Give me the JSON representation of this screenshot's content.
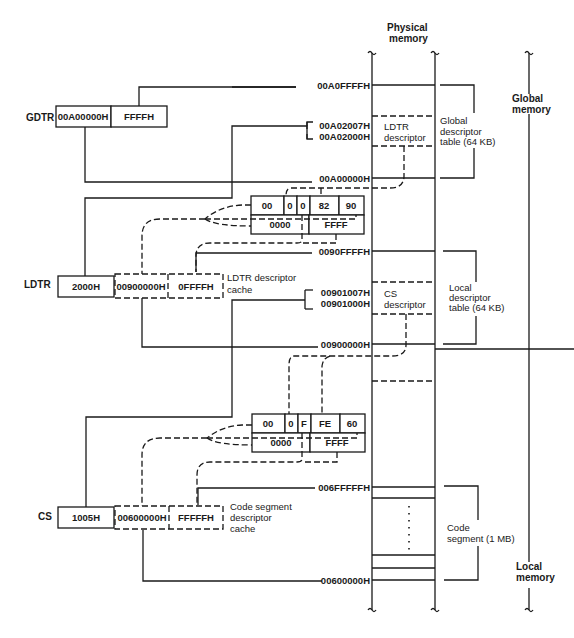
{
  "header": {
    "physical_memory_line1": "Physical",
    "physical_memory_line2": "memory"
  },
  "registers": {
    "gdtr": {
      "label": "GDTR",
      "base": "00A00000H",
      "limit": "FFFFH"
    },
    "ldtr": {
      "label": "LDTR",
      "selector": "2000H",
      "cache_base": "00900000H",
      "cache_limit": "0FFFFH",
      "cache_label_line1": "LDTR descriptor",
      "cache_label_line2": "cache"
    },
    "cs": {
      "label": "CS",
      "selector": "1005H",
      "cache_base": "00600000H",
      "cache_limit": "FFFFFH",
      "cache_label_line1": "Code segment",
      "cache_label_line2": "descriptor",
      "cache_label_line3": "cache"
    }
  },
  "ldtr_descriptor": {
    "top_fields": [
      "00",
      "0",
      "0",
      "82",
      "90"
    ],
    "bottom_fields": [
      "0000",
      "FFFF"
    ]
  },
  "cs_descriptor": {
    "top_fields": [
      "00",
      "0",
      "F",
      "FE",
      "60"
    ],
    "bottom_fields": [
      "0000",
      "FFFF"
    ]
  },
  "addresses": {
    "gdt_top": "00A0FFFFH",
    "ldtr_desc_hi": "00A02007H",
    "ldtr_desc_lo": "00A02000H",
    "gdt_base": "00A00000H",
    "ldt_top": "0090FFFFH",
    "cs_desc_hi": "00901007H",
    "cs_desc_lo": "00901000H",
    "ldt_base": "00900000H",
    "code_top": "006FFFFFH",
    "code_base": "00600000H"
  },
  "memory_regions": {
    "ldtr_descriptor_line1": "LDTR",
    "ldtr_descriptor_line2": "descriptor",
    "cs_descriptor_line1": "CS",
    "cs_descriptor_line2": "descriptor",
    "gdt_line1": "Global",
    "gdt_line2": "descriptor",
    "gdt_line3": "table (64 KB)",
    "ldt_line1": "Local",
    "ldt_line2": "descriptor",
    "ldt_line3": "table (64 KB)",
    "code_line1": "Code",
    "code_line2": "segment (1 MB)"
  },
  "memory_spaces": {
    "global_line1": "Global",
    "global_line2": "memory",
    "local_line1": "Local",
    "local_line2": "memory"
  }
}
